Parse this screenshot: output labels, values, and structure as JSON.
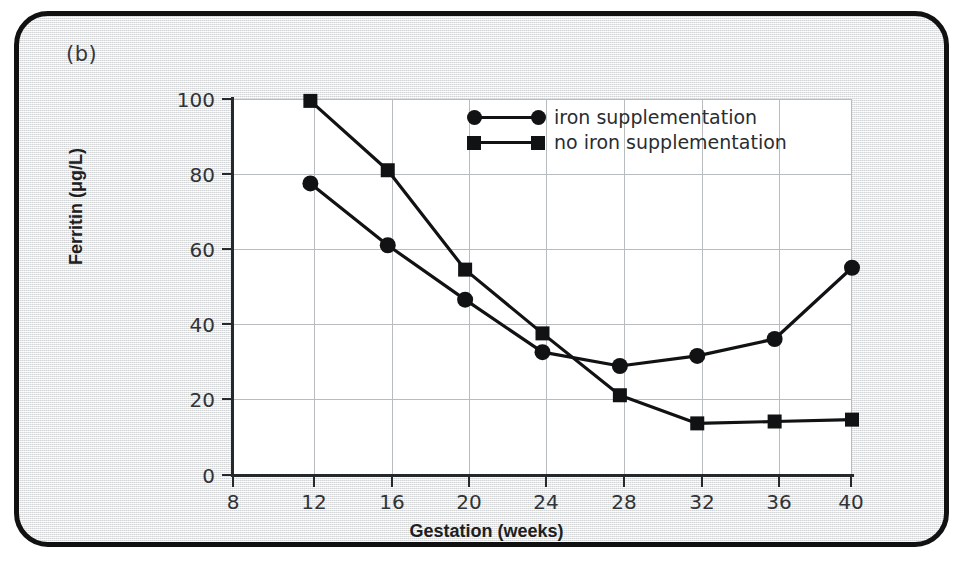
{
  "panel": {
    "label": "(b)"
  },
  "chart_data": {
    "type": "line",
    "title": "",
    "xlabel": "Gestation (weeks)",
    "ylabel": "Ferritin (μg/L)",
    "x": [
      12,
      16,
      20,
      24,
      28,
      32,
      36,
      40
    ],
    "xlim": [
      8,
      40
    ],
    "ylim": [
      0,
      100
    ],
    "xticks": [
      "8",
      "12",
      "16",
      "20",
      "24",
      "28",
      "32",
      "36",
      "40"
    ],
    "xtick_values": [
      8,
      12,
      16,
      20,
      24,
      28,
      32,
      36,
      40
    ],
    "yticks": [
      "0",
      "20",
      "40",
      "60",
      "80",
      "100"
    ],
    "ytick_values": [
      0,
      20,
      40,
      60,
      80,
      100
    ],
    "grid": true,
    "legend_position": "upper center",
    "series": [
      {
        "name": "iron supplementation",
        "marker": "circle",
        "color": "#101213",
        "x": [
          12,
          16,
          20,
          24,
          28,
          32,
          36,
          40
        ],
        "values": [
          77.5,
          61,
          46.5,
          32.5,
          28.8,
          31.5,
          36,
          55
        ]
      },
      {
        "name": "no iron supplementation",
        "marker": "square",
        "color": "#101213",
        "x": [
          12,
          16,
          20,
          24,
          28,
          32,
          36,
          40
        ],
        "values": [
          99.5,
          81,
          54.5,
          37.5,
          21,
          13.5,
          14,
          14.5
        ]
      }
    ]
  },
  "legend": {
    "items": [
      {
        "label": "iron supplementation",
        "marker": "circle"
      },
      {
        "label": "no iron supplementation",
        "marker": "square"
      }
    ]
  }
}
